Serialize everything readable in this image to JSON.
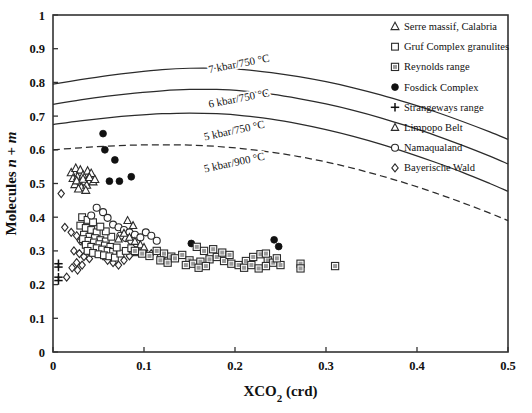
{
  "chart_data": {
    "type": "scatter",
    "title": "",
    "xlabel": "XCO2 (crd)",
    "xlabel_parts": {
      "main": "XCO",
      "sub": "2",
      "tail": " (crd)"
    },
    "ylabel": "Molecules n + m",
    "ylabel_parts": {
      "lead": "Molecules ",
      "n": "n",
      "plus": " + ",
      "m": "m"
    },
    "xlim": [
      0,
      0.5
    ],
    "ylim": [
      0,
      1
    ],
    "xticks": [
      "0",
      "0.1",
      "0.2",
      "0.3",
      "0.4",
      "0.5"
    ],
    "xtick_values": [
      0,
      0.1,
      0.2,
      0.3,
      0.4,
      0.5
    ],
    "yticks": [
      "0",
      "0.1",
      "0.2",
      "0.3",
      "0.4",
      "0.5",
      "0.6",
      "0.7",
      "0.8",
      "0.9",
      "1"
    ],
    "ytick_values": [
      0,
      0.1,
      0.2,
      0.3,
      0.4,
      0.5,
      0.6,
      0.7,
      0.8,
      0.9,
      1
    ],
    "grid": false,
    "legend_position": "top-right",
    "frame_color": "#333333",
    "curve_color": "#2b2b2b",
    "marker_gray": "#9a9a9a",
    "legend": [
      {
        "label": "Serre massif, Calabria",
        "marker": "triangle-open",
        "key": "serre"
      },
      {
        "label": "Gruf Complex granulites",
        "marker": "square-open",
        "key": "gruf"
      },
      {
        "label": "Reynolds range",
        "marker": "square-gray",
        "key": "reynolds"
      },
      {
        "label": "Fosdick Complex",
        "marker": "circle-filled",
        "key": "fosdick"
      },
      {
        "label": "Strangeways range",
        "marker": "plus",
        "key": "strangeways"
      },
      {
        "label": "Limpopo Belt",
        "marker": "triangle-open-small",
        "key": "limpopo"
      },
      {
        "label": "Namaqualand",
        "marker": "circle-open",
        "key": "namaqualand"
      },
      {
        "label": "Bayerische Wald",
        "marker": "diamond-open",
        "key": "bayerische"
      }
    ],
    "curves": [
      {
        "label": "7 kbar/750 °C",
        "style": "solid",
        "label_x": 0.205,
        "label_y": 0.845,
        "label_rot": -11,
        "points": [
          [
            0,
            0.795
          ],
          [
            0.03,
            0.808
          ],
          [
            0.06,
            0.82
          ],
          [
            0.09,
            0.83
          ],
          [
            0.12,
            0.838
          ],
          [
            0.15,
            0.842
          ],
          [
            0.18,
            0.842
          ],
          [
            0.21,
            0.838
          ],
          [
            0.24,
            0.829
          ],
          [
            0.27,
            0.817
          ],
          [
            0.3,
            0.802
          ],
          [
            0.33,
            0.784
          ],
          [
            0.36,
            0.763
          ],
          [
            0.39,
            0.739
          ],
          [
            0.42,
            0.713
          ],
          [
            0.45,
            0.684
          ],
          [
            0.48,
            0.653
          ],
          [
            0.5,
            0.631
          ]
        ]
      },
      {
        "label": "6 kbar/750 °C",
        "style": "solid",
        "label_x": 0.205,
        "label_y": 0.742,
        "label_rot": -11,
        "points": [
          [
            0,
            0.735
          ],
          [
            0.03,
            0.748
          ],
          [
            0.06,
            0.759
          ],
          [
            0.09,
            0.768
          ],
          [
            0.12,
            0.775
          ],
          [
            0.15,
            0.779
          ],
          [
            0.18,
            0.779
          ],
          [
            0.21,
            0.774
          ],
          [
            0.24,
            0.765
          ],
          [
            0.27,
            0.752
          ],
          [
            0.3,
            0.736
          ],
          [
            0.33,
            0.717
          ],
          [
            0.36,
            0.695
          ],
          [
            0.39,
            0.67
          ],
          [
            0.42,
            0.643
          ],
          [
            0.45,
            0.613
          ],
          [
            0.48,
            0.581
          ],
          [
            0.5,
            0.558
          ]
        ]
      },
      {
        "label": "5 kbar/750 °C",
        "style": "solid",
        "label_x": 0.2,
        "label_y": 0.647,
        "label_rot": -12,
        "points": [
          [
            0,
            0.675
          ],
          [
            0.03,
            0.686
          ],
          [
            0.06,
            0.695
          ],
          [
            0.09,
            0.702
          ],
          [
            0.12,
            0.707
          ],
          [
            0.15,
            0.709
          ],
          [
            0.18,
            0.707
          ],
          [
            0.21,
            0.701
          ],
          [
            0.24,
            0.691
          ],
          [
            0.27,
            0.677
          ],
          [
            0.3,
            0.66
          ],
          [
            0.33,
            0.64
          ],
          [
            0.36,
            0.617
          ],
          [
            0.39,
            0.591
          ],
          [
            0.42,
            0.563
          ],
          [
            0.45,
            0.533
          ],
          [
            0.48,
            0.5
          ],
          [
            0.5,
            0.477
          ]
        ]
      },
      {
        "label": "5 kbar/900 °C",
        "style": "dashed",
        "label_x": 0.2,
        "label_y": 0.552,
        "label_rot": -12,
        "points": [
          [
            0,
            0.6
          ],
          [
            0.03,
            0.606
          ],
          [
            0.06,
            0.611
          ],
          [
            0.09,
            0.614
          ],
          [
            0.12,
            0.615
          ],
          [
            0.15,
            0.614
          ],
          [
            0.18,
            0.61
          ],
          [
            0.21,
            0.603
          ],
          [
            0.24,
            0.593
          ],
          [
            0.27,
            0.58
          ],
          [
            0.3,
            0.564
          ],
          [
            0.33,
            0.545
          ],
          [
            0.36,
            0.523
          ],
          [
            0.39,
            0.499
          ],
          [
            0.42,
            0.472
          ],
          [
            0.45,
            0.443
          ],
          [
            0.48,
            0.412
          ],
          [
            0.5,
            0.39
          ]
        ]
      }
    ],
    "series": [
      {
        "name": "Fosdick Complex",
        "marker": "circle-filled",
        "points": [
          [
            0.055,
            0.648
          ],
          [
            0.057,
            0.6
          ],
          [
            0.068,
            0.57
          ],
          [
            0.062,
            0.507
          ],
          [
            0.073,
            0.507
          ],
          [
            0.086,
            0.52
          ],
          [
            0.152,
            0.322
          ],
          [
            0.243,
            0.333
          ],
          [
            0.248,
            0.313
          ]
        ]
      },
      {
        "name": "Serre massif, Calabria",
        "marker": "triangle-open",
        "points": [
          [
            0.02,
            0.532
          ],
          [
            0.025,
            0.545
          ],
          [
            0.03,
            0.54
          ],
          [
            0.022,
            0.515
          ],
          [
            0.027,
            0.52
          ],
          [
            0.033,
            0.525
          ],
          [
            0.038,
            0.537
          ],
          [
            0.042,
            0.53
          ],
          [
            0.035,
            0.505
          ],
          [
            0.029,
            0.5
          ],
          [
            0.024,
            0.497
          ],
          [
            0.031,
            0.489
          ],
          [
            0.037,
            0.495
          ],
          [
            0.044,
            0.505
          ],
          [
            0.026,
            0.508
          ],
          [
            0.033,
            0.513
          ],
          [
            0.04,
            0.518
          ],
          [
            0.046,
            0.512
          ],
          [
            0.028,
            0.484
          ],
          [
            0.036,
            0.48
          ]
        ]
      },
      {
        "name": "Bayerische Wald",
        "marker": "diamond-open",
        "points": [
          [
            0.009,
            0.47
          ],
          [
            0.013,
            0.37
          ],
          [
            0.02,
            0.355
          ],
          [
            0.026,
            0.345
          ],
          [
            0.03,
            0.33
          ],
          [
            0.035,
            0.318
          ],
          [
            0.023,
            0.3
          ],
          [
            0.029,
            0.292
          ],
          [
            0.034,
            0.283
          ],
          [
            0.04,
            0.277
          ],
          [
            0.026,
            0.265
          ],
          [
            0.032,
            0.258
          ],
          [
            0.021,
            0.25
          ],
          [
            0.027,
            0.243
          ],
          [
            0.015,
            0.222
          ],
          [
            0.038,
            0.3
          ],
          [
            0.044,
            0.31
          ],
          [
            0.05,
            0.295
          ],
          [
            0.055,
            0.285
          ],
          [
            0.06,
            0.272
          ],
          [
            0.066,
            0.265
          ],
          [
            0.072,
            0.258
          ],
          [
            0.078,
            0.272
          ],
          [
            0.084,
            0.285
          ],
          [
            0.1,
            0.3
          ],
          [
            0.108,
            0.292
          ],
          [
            0.118,
            0.285
          ],
          [
            0.126,
            0.278
          ]
        ]
      },
      {
        "name": "Gruf Complex granulites",
        "marker": "square-open",
        "points": [
          [
            0.032,
            0.4
          ],
          [
            0.038,
            0.392
          ],
          [
            0.044,
            0.385
          ],
          [
            0.03,
            0.375
          ],
          [
            0.036,
            0.368
          ],
          [
            0.042,
            0.362
          ],
          [
            0.048,
            0.355
          ],
          [
            0.034,
            0.348
          ],
          [
            0.04,
            0.342
          ],
          [
            0.046,
            0.338
          ],
          [
            0.052,
            0.332
          ],
          [
            0.058,
            0.328
          ],
          [
            0.033,
            0.335
          ],
          [
            0.039,
            0.33
          ],
          [
            0.045,
            0.325
          ],
          [
            0.051,
            0.32
          ],
          [
            0.057,
            0.316
          ],
          [
            0.063,
            0.312
          ],
          [
            0.036,
            0.318
          ],
          [
            0.042,
            0.312
          ],
          [
            0.048,
            0.308
          ],
          [
            0.054,
            0.304
          ],
          [
            0.06,
            0.3
          ],
          [
            0.066,
            0.297
          ],
          [
            0.038,
            0.3
          ],
          [
            0.044,
            0.294
          ],
          [
            0.05,
            0.29
          ],
          [
            0.056,
            0.287
          ],
          [
            0.062,
            0.284
          ],
          [
            0.068,
            0.28
          ],
          [
            0.074,
            0.292
          ],
          [
            0.08,
            0.3
          ],
          [
            0.086,
            0.308
          ],
          [
            0.092,
            0.296
          ],
          [
            0.07,
            0.31
          ],
          [
            0.064,
            0.342
          ],
          [
            0.058,
            0.358
          ],
          [
            0.052,
            0.372
          ]
        ]
      },
      {
        "name": "Namaqualand",
        "marker": "circle-open",
        "points": [
          [
            0.048,
            0.428
          ],
          [
            0.055,
            0.415
          ],
          [
            0.042,
            0.405
          ],
          [
            0.06,
            0.398
          ],
          [
            0.066,
            0.378
          ],
          [
            0.072,
            0.37
          ],
          [
            0.078,
            0.362
          ],
          [
            0.084,
            0.355
          ],
          [
            0.09,
            0.348
          ],
          [
            0.096,
            0.34
          ],
          [
            0.102,
            0.355
          ],
          [
            0.108,
            0.345
          ],
          [
            0.114,
            0.33
          ],
          [
            0.092,
            0.322
          ],
          [
            0.086,
            0.33
          ],
          [
            0.08,
            0.338
          ],
          [
            0.074,
            0.345
          ]
        ]
      },
      {
        "name": "Limpopo Belt",
        "marker": "triangle-open-small",
        "points": [
          [
            0.082,
            0.39
          ],
          [
            0.088,
            0.375
          ],
          [
            0.078,
            0.352
          ],
          [
            0.084,
            0.34
          ],
          [
            0.09,
            0.328
          ],
          [
            0.096,
            0.318
          ],
          [
            0.072,
            0.335
          ],
          [
            0.1,
            0.31
          ]
        ]
      },
      {
        "name": "Strangeways range",
        "marker": "plus",
        "points": [
          [
            0.006,
            0.262
          ],
          [
            0.006,
            0.252
          ],
          [
            0.006,
            0.222
          ],
          [
            0.006,
            0.212
          ]
        ]
      },
      {
        "name": "Reynolds range",
        "marker": "square-gray",
        "points": [
          [
            0.09,
            0.3
          ],
          [
            0.098,
            0.292
          ],
          [
            0.106,
            0.285
          ],
          [
            0.114,
            0.3
          ],
          [
            0.122,
            0.292
          ],
          [
            0.13,
            0.283
          ],
          [
            0.118,
            0.272
          ],
          [
            0.126,
            0.265
          ],
          [
            0.134,
            0.278
          ],
          [
            0.142,
            0.288
          ],
          [
            0.15,
            0.272
          ],
          [
            0.158,
            0.312
          ],
          [
            0.166,
            0.3
          ],
          [
            0.146,
            0.258
          ],
          [
            0.154,
            0.262
          ],
          [
            0.162,
            0.268
          ],
          [
            0.172,
            0.275
          ],
          [
            0.18,
            0.282
          ],
          [
            0.188,
            0.27
          ],
          [
            0.196,
            0.262
          ],
          [
            0.204,
            0.258
          ],
          [
            0.186,
            0.295
          ],
          [
            0.194,
            0.288
          ],
          [
            0.212,
            0.27
          ],
          [
            0.22,
            0.282
          ],
          [
            0.228,
            0.29
          ],
          [
            0.236,
            0.272
          ],
          [
            0.21,
            0.25
          ],
          [
            0.218,
            0.258
          ],
          [
            0.226,
            0.248
          ],
          [
            0.234,
            0.255
          ],
          [
            0.242,
            0.265
          ],
          [
            0.25,
            0.258
          ],
          [
            0.176,
            0.305
          ],
          [
            0.168,
            0.255
          ],
          [
            0.16,
            0.25
          ],
          [
            0.234,
            0.292
          ],
          [
            0.246,
            0.278
          ],
          [
            0.272,
            0.262
          ],
          [
            0.272,
            0.248
          ],
          [
            0.31,
            0.255
          ]
        ]
      }
    ]
  }
}
